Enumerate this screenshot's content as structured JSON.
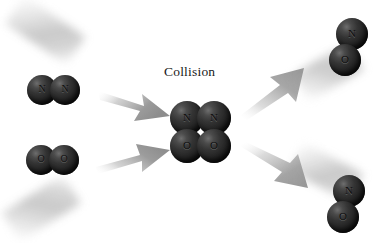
{
  "diagram": {
    "caption": "Collision",
    "type": "chemical-reaction-collision",
    "accent_color": "#2a2a2a",
    "arrow_color": "#9a9a9a",
    "background_color": "#ffffff"
  },
  "reactants": [
    {
      "id": "n2",
      "name": "nitrogen-molecule",
      "atoms": [
        {
          "label": "N"
        },
        {
          "label": "N"
        }
      ]
    },
    {
      "id": "o2",
      "name": "oxygen-molecule",
      "atoms": [
        {
          "label": "O"
        },
        {
          "label": "O"
        }
      ]
    }
  ],
  "collision_complex": {
    "id": "collision-complex",
    "name": "collision-complex",
    "atoms": [
      {
        "label": "N"
      },
      {
        "label": "N"
      },
      {
        "label": "O"
      },
      {
        "label": "O"
      }
    ]
  },
  "products": [
    {
      "id": "no-top",
      "name": "nitric-oxide-molecule-top",
      "atoms": [
        {
          "label": "N"
        },
        {
          "label": "O"
        }
      ]
    },
    {
      "id": "no-bottom",
      "name": "nitric-oxide-molecule-bottom",
      "atoms": [
        {
          "label": "N"
        },
        {
          "label": "O"
        }
      ]
    }
  ],
  "arrows": [
    {
      "id": "in-top",
      "direction": "down-right"
    },
    {
      "id": "in-bottom",
      "direction": "up-right"
    },
    {
      "id": "out-top",
      "direction": "up-right"
    },
    {
      "id": "out-bottom",
      "direction": "down-right"
    }
  ]
}
